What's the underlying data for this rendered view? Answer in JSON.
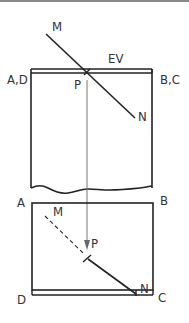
{
  "diagram": {
    "type": "engineering-projection",
    "elevation_view": {
      "corner_labels": {
        "left": "A,D",
        "right": "B,C"
      },
      "edge_view_label": "EV",
      "line_endpoints": {
        "start": "M",
        "end": "N"
      },
      "piercing_point": "P"
    },
    "plan_view": {
      "corner_labels": {
        "top_left": "A",
        "top_right": "B",
        "bottom_left": "D",
        "bottom_right": "C"
      },
      "line_endpoints": {
        "start": "M",
        "end": "N"
      },
      "piercing_point": "P"
    },
    "colors": {
      "line": "#222222",
      "projector": "#777777",
      "text": "#333333"
    }
  }
}
